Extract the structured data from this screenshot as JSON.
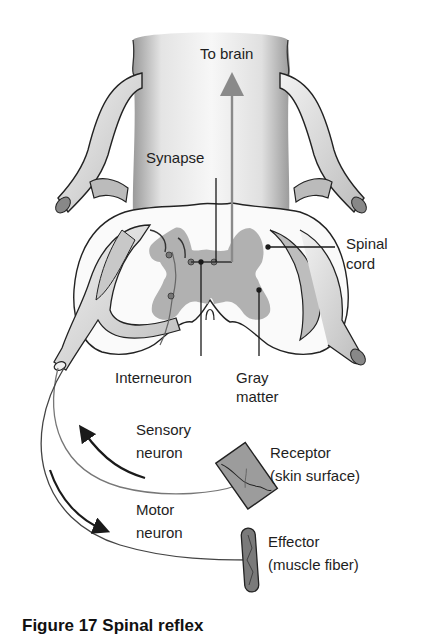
{
  "figure": {
    "caption": "Figure 17  Spinal reflex",
    "labels": {
      "to_brain": "To brain",
      "synapse": "Synapse",
      "spinal_cord_line1": "Spinal",
      "spinal_cord_line2": "cord",
      "interneuron": "Interneuron",
      "gray_matter_line1": "Gray",
      "gray_matter_line2": "matter",
      "sensory_neuron_line1": "Sensory",
      "sensory_neuron_line2": "neuron",
      "receptor_line1": "Receptor",
      "receptor_line2": "(skin surface)",
      "motor_neuron_line1": "Motor",
      "motor_neuron_line2": "neuron",
      "effector_line1": "Effector",
      "effector_line2": "(muscle fiber)"
    },
    "colors": {
      "outline": "#222222",
      "gray_matter": "#a9a9a9",
      "vertebra_fill": "#ececec",
      "receptor_fill": "#9c9c9c",
      "effector_fill": "#7a7a7a",
      "brain_arrow": "#8a8a8a"
    }
  }
}
